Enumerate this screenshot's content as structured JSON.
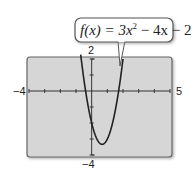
{
  "chart_data": {
    "type": "line",
    "title": "",
    "function": "f(x) = 3x^2 - 4x - 2",
    "series": [
      {
        "name": "f(x) = 3x^2 - 4x - 2",
        "x": [
          -1,
          -0.5,
          0,
          0.5,
          0.667,
          1,
          1.5,
          2
        ],
        "y": [
          5,
          0.75,
          -2,
          -3.25,
          -3.333,
          -3,
          -1.25,
          2
        ]
      }
    ],
    "xlim": [
      -4,
      5
    ],
    "ylim": [
      -4,
      2
    ],
    "xtick_step": 1,
    "ytick_step": 1,
    "window_labels": {
      "xmin": "−4",
      "xmax": "5",
      "ymin": "−4",
      "ymax": "2"
    },
    "annotation": "f(x) = 3x² − 4x − 2",
    "grid": false,
    "legend": "none",
    "colors": {
      "screen": "#d6d6d6",
      "frame": "#555555",
      "curve": "#222222",
      "axis": "#333333"
    }
  },
  "labels": {
    "xmin": "−4",
    "xmax": "5",
    "ymax": "2",
    "ymin": "−4",
    "callout_fx": "f(x) = 3x",
    "callout_exp": "2",
    "callout_rest": " − 4x − 2"
  }
}
